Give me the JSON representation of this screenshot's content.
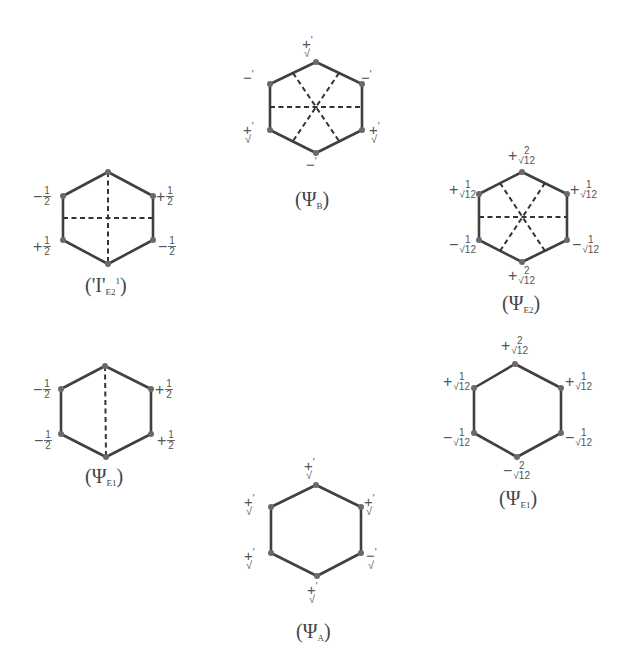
{
  "figure": {
    "line_color": "#404040",
    "vertex_color": "#6a6a6a",
    "diagrams": [
      {
        "id": "psi_b",
        "caption": {
          "open": "(",
          "symbol": "Ψ",
          "sub": "B",
          "sup": "",
          "close": ")"
        },
        "coefficients": {
          "top": "+'/√",
          "upper_left": "−'",
          "upper_right": "−'",
          "lower_left": "+'/√",
          "lower_right": "+'/√",
          "bottom": "−'"
        },
        "nodal_lines": 3
      },
      {
        "id": "psi_e2_prime",
        "caption": {
          "open": "(",
          "symbol": "'Ι'",
          "sub": "E2",
          "sup": "1",
          "close": ")"
        },
        "coefficients": {
          "upper_left": "−1/2",
          "upper_right": "+1/2",
          "lower_left": "+1/2",
          "lower_right": "−1/2"
        },
        "nodal_lines": 2
      },
      {
        "id": "psi_e2",
        "caption": {
          "open": "(",
          "symbol": "Ψ",
          "sub": "E2",
          "sup": "",
          "close": ")"
        },
        "coefficients": {
          "top": "+2/√12",
          "upper_left": "+1/√12",
          "upper_right": "+1/√12",
          "lower_left": "−1/√12",
          "lower_right": "−1/√12",
          "bottom": "+2/√12"
        },
        "nodal_lines": 3
      },
      {
        "id": "psi_e1_left",
        "caption": {
          "open": "(",
          "symbol": "Ψ",
          "sub": "E1",
          "sup": "",
          "close": ")"
        },
        "coefficients": {
          "upper_left": "−1/2",
          "upper_right": "+1/2",
          "lower_left": "−1/2",
          "lower_right": "+1/2"
        },
        "nodal_lines": 1
      },
      {
        "id": "psi_e1_right",
        "caption": {
          "open": "(",
          "symbol": "Ψ",
          "sub": "E1",
          "sup": "",
          "close": ")"
        },
        "coefficients": {
          "top": "+2/√12",
          "upper_left": "+1/√12",
          "upper_right": "+1/√12",
          "lower_left": "−1/√12",
          "lower_right": "−1/√12",
          "bottom": "−2/√12"
        },
        "nodal_lines": 0
      },
      {
        "id": "psi_a",
        "caption": {
          "open": "(",
          "symbol": "Ψ",
          "sub": "A",
          "sup": "",
          "close": ")"
        },
        "coefficients": {
          "top": "+'/√",
          "upper_left": "+'/√",
          "upper_right": "+'/√",
          "lower_left": "+'/√",
          "lower_right": "−'/√",
          "bottom": "+'/√"
        },
        "nodal_lines": 0
      }
    ],
    "text": {
      "plus": "+",
      "minus": "−",
      "prime": "'",
      "root": "√",
      "one": "1",
      "two": "2",
      "half_num": "1",
      "half_den": "2",
      "r12": "√12"
    }
  }
}
